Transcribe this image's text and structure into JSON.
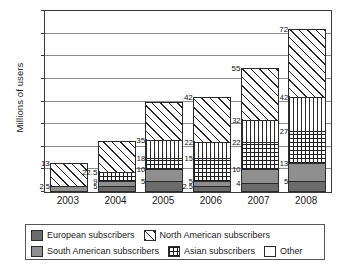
{
  "chart_data": {
    "type": "bar",
    "subtype": "stacked-bar",
    "title": "",
    "xlabel": "",
    "ylabel": "Millions of users",
    "ylim": [
      0,
      80
    ],
    "ytick_step": 10,
    "yticks": [
      "0",
      "10",
      "20",
      "30",
      "40",
      "50",
      "60",
      "70",
      "80"
    ],
    "grid": true,
    "legend_position": "bottom",
    "categories": [
      "2003",
      "2004",
      "2005",
      "2006",
      "2007",
      "2008"
    ],
    "series": [
      {
        "name": "European subscribers",
        "pattern": "solid-dark-gray",
        "values": [
          0,
          2.5,
          5,
          2.5,
          4,
          5
        ]
      },
      {
        "name": "South American subscribers",
        "pattern": "solid-medium-gray",
        "values": [
          2.5,
          2.5,
          5,
          2.5,
          6,
          8
        ]
      },
      {
        "name": "Asian subscribers",
        "pattern": "cross-hatch-grid",
        "values": [
          0,
          4,
          5,
          10,
          12,
          14
        ]
      },
      {
        "name": "Other",
        "pattern": "vertical-stripes",
        "values": [
          0,
          0,
          8,
          7,
          10,
          15
        ]
      },
      {
        "name": "North American subscribers",
        "pattern": "diagonal-hatch",
        "values": [
          10.5,
          13.5,
          17,
          20,
          23,
          30
        ]
      }
    ],
    "cumulative_labels": [
      {
        "category": "2003",
        "marks": [
          "2.5",
          "13"
        ]
      },
      {
        "category": "2004",
        "marks": [
          "5",
          "9",
          "22.5"
        ]
      },
      {
        "category": "2005",
        "marks": [
          "5",
          "10",
          "18",
          "35"
        ]
      },
      {
        "category": "2006",
        "marks": [
          "2.5",
          "5",
          "15",
          "22",
          "42"
        ]
      },
      {
        "category": "2007",
        "marks": [
          "4",
          "10",
          "22",
          "32",
          "55"
        ]
      },
      {
        "category": "2008",
        "marks": [
          "5",
          "13",
          "27",
          "42",
          "72"
        ]
      }
    ]
  },
  "legend": {
    "rows": [
      [
        {
          "label": "European subscribers",
          "swatch": "solid-dark-gray"
        },
        {
          "label": "North American subscribers",
          "swatch": "diagonal-hatch"
        }
      ],
      [
        {
          "label": "South American subscribers",
          "swatch": "solid-medium-gray"
        },
        {
          "label": "Asian subscribers",
          "swatch": "cross-hatch-grid"
        },
        {
          "label": "Other",
          "swatch": "empty-white"
        }
      ]
    ]
  },
  "colors": {
    "european": "#6b6b6b",
    "south_american": "#8f8f8f",
    "outline": "#2b2b2b",
    "gridline": "#8d8d8d",
    "background": "#ffffff"
  }
}
